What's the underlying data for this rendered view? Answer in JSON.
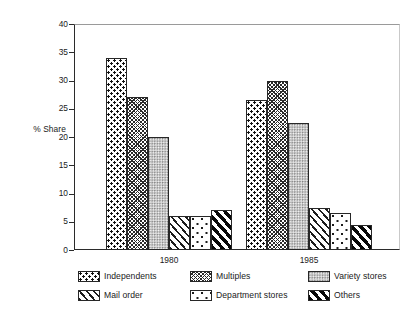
{
  "chart_data": {
    "type": "bar",
    "title": "",
    "subtitle": "",
    "xlabel": "",
    "ylabel": "% Share",
    "ylim": [
      0,
      40
    ],
    "ytick_step": 5,
    "yticks": [
      "40",
      "35",
      "30",
      "25",
      "20",
      "15",
      "10",
      "5",
      "0"
    ],
    "grid": false,
    "legend_position": "bottom",
    "categories": [
      "1980",
      "1985"
    ],
    "series": [
      {
        "name": "Independents",
        "pattern": "dots-dense",
        "values": [
          34,
          26.5
        ]
      },
      {
        "name": "Multiples",
        "pattern": "weave",
        "values": [
          27,
          30
        ]
      },
      {
        "name": "Variety stores",
        "pattern": "stipple",
        "values": [
          20,
          22.5
        ]
      },
      {
        "name": "Mail order",
        "pattern": "diag",
        "values": [
          6,
          7.5
        ]
      },
      {
        "name": "Department stores",
        "pattern": "speckle",
        "values": [
          6,
          6.5
        ]
      },
      {
        "name": "Others",
        "pattern": "bold-diag",
        "values": [
          7,
          4.5
        ]
      }
    ]
  },
  "axis": {
    "y_title": "% Share",
    "y_labels": [
      "40",
      "35",
      "30",
      "25",
      "20",
      "15",
      "10",
      "5",
      "0"
    ],
    "x_labels": [
      "1980",
      "1985"
    ]
  },
  "legend": {
    "items": [
      {
        "label": "Independents",
        "pattern": "dots-dense"
      },
      {
        "label": "Multiples",
        "pattern": "weave"
      },
      {
        "label": "Variety stores",
        "pattern": "stipple"
      },
      {
        "label": "Mail order",
        "pattern": "diag"
      },
      {
        "label": "Department stores",
        "pattern": "speckle"
      },
      {
        "label": "Others",
        "pattern": "bold-diag"
      }
    ]
  },
  "colors": {
    "axis": "#2b2b2b",
    "ink": "#1a1a1a",
    "background": "#ffffff",
    "stipple_fill": "#cfcfcf"
  }
}
